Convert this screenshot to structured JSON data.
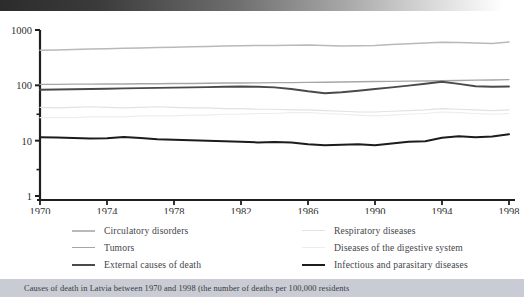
{
  "caption": {
    "text": "Causes of death in Latvia between 1970 and 1998 (the number of deaths per 100,000 residents"
  },
  "legend": {
    "items": [
      {
        "label": "Circulatory disorders",
        "color": "#b9b9b9",
        "width": "2.2px",
        "column": "left"
      },
      {
        "label": "Tumors",
        "color": "#a6a6a6",
        "width": "1.8px",
        "column": "left"
      },
      {
        "label": "External causes of death",
        "color": "#4a4a4a",
        "width": "2.6px",
        "column": "left"
      },
      {
        "label": "Respiratory diseases",
        "color": "#e2e2e2",
        "width": "1.6px",
        "column": "right"
      },
      {
        "label": "Diseases of the digestive system",
        "color": "#ededed",
        "width": "1.6px",
        "column": "right"
      },
      {
        "label": "Infectious and parasitary diseases",
        "color": "#1c1c1c",
        "width": "2.8px",
        "column": "right"
      }
    ]
  },
  "axes": {
    "y_ticks": [
      "1000",
      "100",
      "10",
      "1"
    ],
    "x_ticks": [
      "1970",
      "1974",
      "1978",
      "1982",
      "1986",
      "1990",
      "1994",
      "1998"
    ]
  },
  "chart_data": {
    "type": "line",
    "title": "Causes of death in Latvia between 1970 and 1998 (the number of deaths per 100,000 residents",
    "xlabel": "",
    "ylabel": "",
    "yscale": "log",
    "ylim": [
      1,
      1000
    ],
    "ytick_values": [
      1000,
      100,
      10,
      1
    ],
    "xlim": [
      1970,
      1998
    ],
    "xtick_values": [
      1970,
      1974,
      1978,
      1982,
      1986,
      1990,
      1994,
      1998
    ],
    "grid": false,
    "legend_position": "below",
    "x": [
      1970,
      1971,
      1972,
      1973,
      1974,
      1975,
      1976,
      1977,
      1978,
      1979,
      1980,
      1981,
      1982,
      1983,
      1984,
      1985,
      1986,
      1987,
      1988,
      1989,
      1990,
      1991,
      1992,
      1993,
      1994,
      1995,
      1996,
      1997,
      1998
    ],
    "series": [
      {
        "name": "Circulatory disorders",
        "color": "#b9b9b9",
        "values": [
          430,
          437,
          444,
          452,
          459,
          466,
          474,
          481,
          489,
          496,
          504,
          512,
          520,
          523,
          527,
          530,
          534,
          524,
          514,
          520,
          527,
          545,
          563,
          582,
          602,
          592,
          583,
          573,
          604
        ]
      },
      {
        "name": "Tumors",
        "color": "#a6a6a6",
        "values": [
          104,
          104,
          105,
          105,
          106,
          106,
          107,
          107,
          108,
          108,
          109,
          110,
          110,
          111,
          112,
          112,
          113,
          114,
          115,
          116,
          117,
          118,
          119,
          120,
          121,
          122,
          124,
          125,
          127
        ]
      },
      {
        "name": "External causes of death",
        "color": "#4a4a4a",
        "values": [
          83,
          84,
          85,
          86,
          87,
          88,
          89,
          90,
          91,
          92,
          93,
          94,
          95,
          94,
          92,
          86,
          78,
          72,
          75,
          80,
          86,
          92,
          99,
          107,
          116,
          106,
          96,
          94,
          95
        ]
      },
      {
        "name": "Respiratory diseases",
        "color": "#e2e2e2",
        "values": [
          40,
          39,
          40,
          41,
          40,
          39,
          40,
          41,
          40,
          39,
          39,
          38,
          38,
          37,
          37,
          36,
          36,
          35,
          34,
          33,
          33,
          34,
          35,
          36,
          38,
          37,
          36,
          35,
          36
        ]
      },
      {
        "name": "Diseases of the digestive system",
        "color": "#ededed",
        "values": [
          26,
          26,
          26,
          27,
          27,
          27,
          28,
          28,
          28,
          29,
          29,
          30,
          30,
          31,
          31,
          32,
          32,
          31,
          30,
          29,
          28,
          29,
          30,
          31,
          33,
          32,
          31,
          30,
          31
        ]
      },
      {
        "name": "Infectious and parasitary diseases",
        "color": "#1c1c1c",
        "values": [
          11.5,
          11.4,
          11.2,
          11.0,
          11.1,
          11.6,
          11.2,
          10.6,
          10.4,
          10.2,
          10.0,
          9.8,
          9.6,
          9.3,
          9.5,
          9.3,
          8.6,
          8.3,
          8.4,
          8.6,
          8.3,
          8.9,
          9.6,
          9.8,
          11.3,
          12.0,
          11.5,
          11.9,
          13.0
        ]
      }
    ]
  }
}
